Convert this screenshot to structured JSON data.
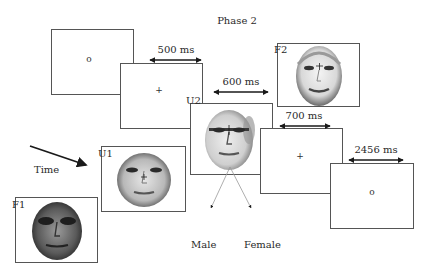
{
  "title": "Phase 2",
  "time_label": "Time",
  "frames": [
    {
      "id": "fixation-o-start",
      "symbol": "o"
    },
    {
      "id": "fixation-plus-1",
      "symbol": "+",
      "duration": "500 ms"
    },
    {
      "id": "U2",
      "label": "U2",
      "duration": "600 ms"
    },
    {
      "id": "F2",
      "label": "F2"
    },
    {
      "id": "fixation-plus-2",
      "symbol": "+",
      "duration": "700 ms"
    },
    {
      "id": "fixation-o-end",
      "symbol": "o",
      "duration": "2456 ms"
    },
    {
      "id": "U1",
      "label": "U1"
    },
    {
      "id": "F1",
      "label": "F1"
    }
  ],
  "responses": {
    "left": "Male",
    "right": "Female"
  },
  "colors": {
    "line": "#555555",
    "arrow": "#1a1a1a",
    "text": "#2a2a2a"
  }
}
